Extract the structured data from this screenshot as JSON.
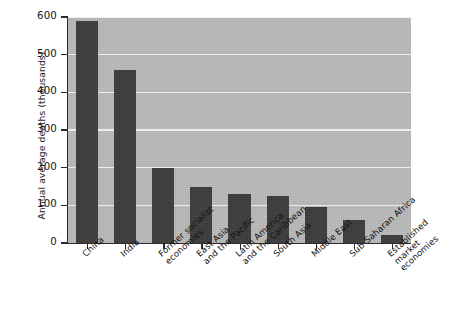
{
  "chart_data": {
    "type": "bar",
    "title": "",
    "xlabel": "",
    "ylabel": "Annual average deaths (thousands)",
    "ylim": [
      0,
      600
    ],
    "yticks": [
      0,
      100,
      200,
      300,
      400,
      500,
      600
    ],
    "ytick_labels": [
      "0",
      "100",
      "200",
      "300",
      "400",
      "500",
      "600"
    ],
    "grid": "horizontal",
    "legend": "none",
    "categories": [
      "China",
      "India",
      "Former socialist\neconomies",
      "East Asia\nand the Pacific",
      "Latin America\nand the Caribbean",
      "South Asia",
      "Middle East",
      "Sub-Saharan Africa",
      "Established\nmarket economies"
    ],
    "values": [
      590,
      460,
      200,
      150,
      130,
      125,
      95,
      62,
      20
    ],
    "colors": {
      "bar": "#3a3a3a",
      "plot_background": "#b8b8b8",
      "gridline": "#f2f2f2",
      "axis": "#2b2b2b",
      "figure_background": "#ffffff",
      "text": "#121212"
    }
  }
}
